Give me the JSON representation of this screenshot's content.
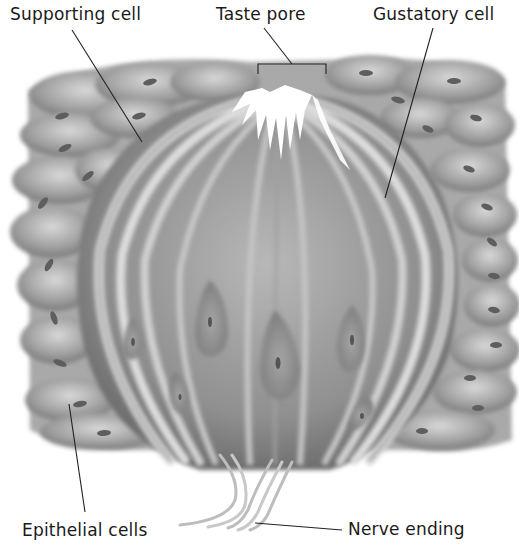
{
  "diagram": {
    "labels": {
      "supporting_cell": "Supporting cell",
      "taste_pore": "Taste pore",
      "gustatory_cell": "Gustatory cell",
      "epithelial_cells": "Epithelial cells",
      "nerve_ending": "Nerve ending"
    },
    "colors": {
      "background": "#ffffff",
      "text": "#1a1a1a",
      "leader_line": "#222222",
      "tissue_dark": "#6e6e6e",
      "tissue_mid": "#9a9a9a",
      "tissue_light": "#cfcfcf",
      "nucleus": "#5a5a5a"
    }
  }
}
